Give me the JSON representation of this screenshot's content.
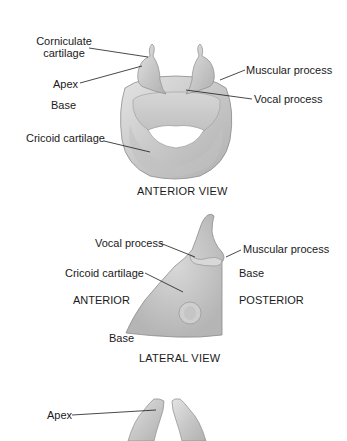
{
  "figures": [
    {
      "id": "anterior",
      "caption": "ANTERIOR VIEW",
      "labels": {
        "corniculate_1": "Corniculate",
        "corniculate_2": "cartilage",
        "apex": "Apex",
        "base": "Base",
        "cricoid": "Cricoid cartilage",
        "muscular": "Muscular process",
        "vocal": "Vocal process"
      }
    },
    {
      "id": "lateral",
      "caption": "LATERAL VIEW",
      "labels": {
        "vocal": "Vocal process",
        "muscular": "Muscular process",
        "cricoid": "Cricoid cartilage",
        "base_right": "Base",
        "anterior": "ANTERIOR",
        "posterior": "POSTERIOR",
        "base_bottom": "Base"
      }
    },
    {
      "id": "posterior_partial",
      "labels": {
        "apex": "Apex"
      }
    }
  ],
  "colors": {
    "cartilage_fill": "#c9c9c9",
    "cartilage_light": "#e2e2e2",
    "cartilage_shadow": "#a8a8a8",
    "outline": "#8c8c8c",
    "leader_line": "#1a1a1a"
  }
}
